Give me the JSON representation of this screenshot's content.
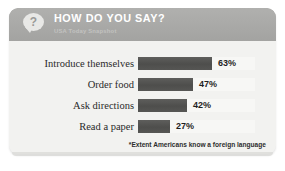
{
  "header": {
    "title": "HOW DO YOU SAY?",
    "subtitle": "USA Today Snapshot",
    "icon": "question-speech-bubble-icon",
    "icon_glyph": "?",
    "band_color": "#a9a9a7"
  },
  "footnote": "*Extent Americans know a foreign language",
  "colors": {
    "card_background": "#efefed",
    "body_background": "#f2f2f0",
    "bar": "#525250",
    "track": "#f7f7f5",
    "title_text": "#ffffff",
    "subtitle_text": "#c2c2c0",
    "label_text": "#2a2a2a"
  },
  "chart_data": {
    "type": "bar",
    "title": "HOW DO YOU SAY?",
    "subtitle": "USA Today Snapshot",
    "orientation": "horizontal",
    "categories": [
      "Introduce themselves",
      "Order food",
      "Ask directions",
      "Read a paper"
    ],
    "values": [
      63,
      47,
      42,
      27
    ],
    "value_labels": [
      "63%",
      "47%",
      "42%",
      "27%"
    ],
    "unit": "percent",
    "xlabel": "",
    "ylabel": "",
    "xlim": [
      0,
      100
    ],
    "grid": false,
    "legend": null,
    "annotations": [
      "*Extent Americans know a foreign language"
    ]
  }
}
